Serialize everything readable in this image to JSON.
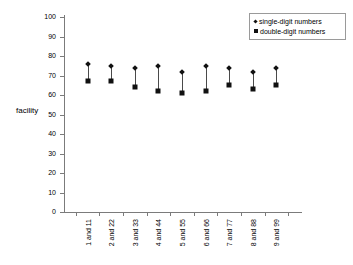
{
  "chart_data": {
    "type": "scatter",
    "title": "",
    "subtitle": "",
    "xlabel": "",
    "ylabel": "facility",
    "ylim": [
      0,
      100
    ],
    "ytick_step": 10,
    "yticks": [
      100,
      90,
      80,
      70,
      60,
      50,
      40,
      30,
      20,
      10,
      0
    ],
    "grid": false,
    "legend_position": "top-right",
    "categories": [
      "1 and 11",
      "2 and 22",
      "3 and 33",
      "4 and 44",
      "5 and 55",
      "6 and 66",
      "7 and 77",
      "8 and 88",
      "9 and 99"
    ],
    "series": [
      {
        "name": "single-digit numbers",
        "marker": "diamond",
        "color": "#111111",
        "values": [
          76,
          75,
          74,
          75,
          72,
          75,
          74,
          72,
          74
        ]
      },
      {
        "name": "double-digit numbers",
        "marker": "square",
        "color": "#111111",
        "values": [
          67,
          67,
          64,
          62,
          61,
          62,
          65,
          63,
          65
        ]
      }
    ],
    "connectors": true
  },
  "legend": {
    "items": [
      {
        "label": "single-digit numbers",
        "marker": "diamond"
      },
      {
        "label": "double-digit numbers",
        "marker": "square"
      }
    ]
  },
  "colors": {
    "axis": "#7b7b7b",
    "marker": "#111111",
    "connector": "#4a4a4a",
    "legend_border": "#9a9a9a",
    "background": "#ffffff"
  }
}
